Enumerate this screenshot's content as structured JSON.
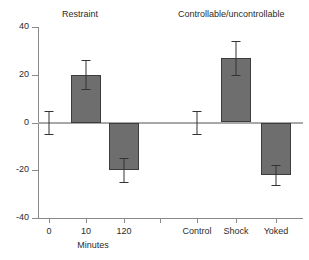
{
  "chart_data": {
    "type": "bar",
    "title": "",
    "subtitle": "",
    "xlabel": "Minutes",
    "ylabel": "",
    "ylim": [
      -40,
      40
    ],
    "yticks": [
      40,
      20,
      0,
      -20,
      -40
    ],
    "ytick_labels": [
      "40",
      "20",
      "0",
      "-20",
      "-40"
    ],
    "grid": false,
    "legend": "none",
    "zero_line": true,
    "error_bars": "symmetric",
    "groups": [
      {
        "name": "Restraint",
        "categories": [
          "0",
          "10",
          "120"
        ],
        "values": [
          0,
          20,
          -20
        ],
        "errors": [
          5,
          6,
          5
        ]
      },
      {
        "name": "Controllable/uncontrollable",
        "categories": [
          "Control",
          "Shock",
          "Yoked"
        ],
        "values": [
          0,
          27,
          -22
        ],
        "errors": [
          5,
          7,
          4
        ]
      }
    ],
    "categories": [
      "0",
      "10",
      "120",
      "Control",
      "Shock",
      "Yoked"
    ],
    "values": [
      0,
      20,
      -20,
      0,
      27,
      -22
    ],
    "errors": [
      5,
      6,
      5,
      5,
      7,
      4
    ],
    "colors": {
      "bar_fill": "#6e6e6e",
      "bar_edge": "#3c3c3c",
      "error_bar": "#333333",
      "axis": "#8a8a8a",
      "zero_line": "#a8a8a8",
      "text": "#2b2b2b",
      "background": "#ffffff"
    }
  },
  "group_titles": {
    "left": "Restraint",
    "right": "Controllable/uncontrollable"
  },
  "axis": {
    "y_labels": [
      "40",
      "20",
      "0",
      "-20",
      "-40"
    ],
    "x_labels": [
      "0",
      "10",
      "120",
      "Control",
      "Shock",
      "Yoked"
    ],
    "x_title": "Minutes"
  }
}
